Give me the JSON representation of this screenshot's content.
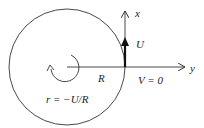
{
  "diagram": {
    "labels": {
      "x_axis": "x",
      "y_axis": "y",
      "velocity_u": "U",
      "velocity_v": "V = 0",
      "radius": "R",
      "yaw_rate": "r = −U/R"
    },
    "colors": {
      "stroke": "#333333",
      "background": "#ffffff"
    }
  }
}
